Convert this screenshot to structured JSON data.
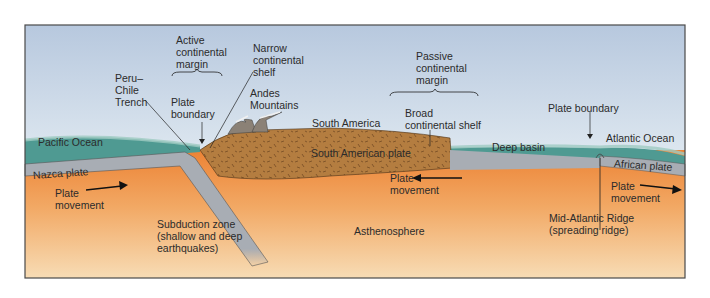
{
  "diagram": {
    "colors": {
      "sky_top": "#b9cbe0",
      "sky_bottom": "#d8e3ee",
      "ocean": "#4f9a92",
      "ocean_light": "#9fcac2",
      "plate_gray": "#a9adb3",
      "continent": "#b27a3c",
      "mantle_top": "#ee8a3c",
      "mantle_bottom": "#f5d3a6",
      "frame": "#4a4a4a"
    },
    "labels": {
      "active_margin": "Active\ncontinental\nmargin",
      "narrow_shelf": "Narrow\ncontinental\nshelf",
      "trench": "Peru–\nChile\nTrench",
      "plate_boundary_left": "Plate\nboundary",
      "andes": "Andes\nMountains",
      "south_america": "South America",
      "passive_margin": "Passive\ncontinental\nmargin",
      "broad_shelf": "Broad\ncontinental shelf",
      "plate_boundary_right": "Plate boundary",
      "pacific_ocean": "Pacific Ocean",
      "atlantic_ocean": "Atlantic Ocean",
      "deep_basin": "Deep basin",
      "nazca_plate": "Nazca plate",
      "south_american_plate": "South American plate",
      "african_plate": "African plate",
      "plate_movement_left": "Plate\nmovement",
      "plate_movement_center": "Plate\nmovement",
      "plate_movement_right": "Plate\nmovement",
      "subduction_zone": "Subduction zone\n(shallow and deep\nearthquakes)",
      "asthenosphere": "Asthenosphere",
      "mid_atlantic_ridge": "Mid-Atlantic Ridge\n(spreading ridge)"
    }
  }
}
